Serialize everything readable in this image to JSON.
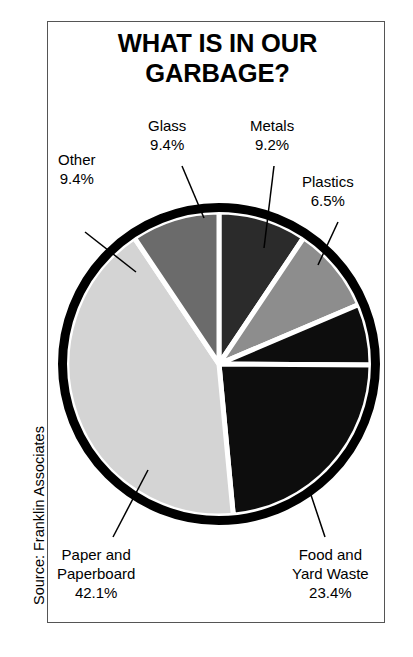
{
  "title": {
    "line1": "WHAT IS IN OUR",
    "line2": "GARBAGE?"
  },
  "source": "Source: Franklin Associates",
  "labels": {
    "glass": {
      "name": "Glass",
      "percent": "9.4%"
    },
    "metals": {
      "name": "Metals",
      "percent": "9.2%"
    },
    "plastics": {
      "name": "Plastics",
      "percent": "6.5%"
    },
    "other": {
      "name": "Other",
      "percent": "9.4%"
    },
    "paper": {
      "name_line1": "Paper and",
      "name_line2": "Paperboard",
      "percent": "42.1%"
    },
    "food": {
      "name_line1": "Food and",
      "name_line2": "Yard Waste",
      "percent": "23.4%"
    }
  },
  "chart_data": {
    "type": "pie",
    "title": "WHAT IS IN OUR GARBAGE?",
    "source": "Source: Franklin Associates",
    "units": "percent of total municipal solid waste",
    "start_angle_deg": -90,
    "direction": "clockwise",
    "separator_color": "#ffffff",
    "separator_width_px": 5,
    "ring_color": "#000000",
    "ring_width_px": 9,
    "legend": "none (direct callout labels with leader lines)",
    "categories": [
      "Glass",
      "Metals",
      "Plastics",
      "Food and Yard Waste",
      "Paper and Paperboard",
      "Other"
    ],
    "values": [
      9.4,
      9.2,
      6.5,
      23.4,
      42.1,
      9.4
    ],
    "labels_text": [
      "9.4%",
      "9.2%",
      "6.5%",
      "23.4%",
      "42.1%",
      "9.4%"
    ],
    "colors": [
      "#2b2b2b",
      "#8d8d8d",
      "#0d0d0d",
      "#0d0d0d",
      "#d4d4d4",
      "#6b6b6b"
    ],
    "total": 100.0,
    "slices": [
      {
        "label": "Glass",
        "value": 9.4,
        "text": "9.4%",
        "fill": "#2b2b2b"
      },
      {
        "label": "Metals",
        "value": 9.2,
        "text": "9.2%",
        "fill": "#8d8d8d"
      },
      {
        "label": "Plastics",
        "value": 6.5,
        "text": "6.5%",
        "fill": "#0d0d0d"
      },
      {
        "label": "Food and Yard Waste",
        "value": 23.4,
        "text": "23.4%",
        "fill": "#0d0d0d"
      },
      {
        "label": "Paper and Paperboard",
        "value": 42.1,
        "text": "42.1%",
        "fill": "#d4d4d4"
      },
      {
        "label": "Other",
        "value": 9.4,
        "text": "9.4%",
        "fill": "#6b6b6b"
      }
    ]
  }
}
